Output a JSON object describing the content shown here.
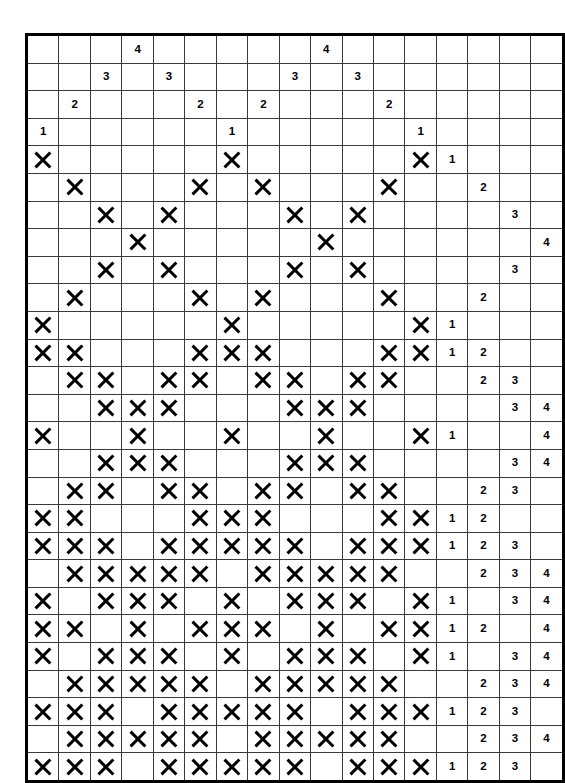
{
  "puzzle": {
    "title": "Nonogram Grid",
    "type": "nonogram",
    "grid_columns": 17,
    "grid_rows": 27,
    "play_columns": 13,
    "play_rows": 23,
    "header_rows": 4,
    "clue_columns": 4,
    "fill_glyph": "X",
    "ink_color": "#000000",
    "line_color": "#3a3a3a",
    "background_color": "#ffffff"
  },
  "column_clues": [
    [
      null,
      null,
      null,
      "1"
    ],
    [
      null,
      null,
      "2",
      null
    ],
    [
      null,
      "3",
      null,
      null
    ],
    [
      "4",
      null,
      null,
      null
    ],
    [
      null,
      "3",
      null,
      null
    ],
    [
      null,
      null,
      "2",
      null
    ],
    [
      null,
      null,
      null,
      "1"
    ],
    [
      null,
      null,
      "2",
      null
    ],
    [
      null,
      "3",
      null,
      null
    ],
    [
      "4",
      null,
      null,
      null
    ],
    [
      null,
      "3",
      null,
      null
    ],
    [
      null,
      null,
      "2",
      null
    ],
    [
      null,
      null,
      null,
      "1"
    ]
  ],
  "row_clues": [
    [
      "1",
      null,
      null,
      null
    ],
    [
      null,
      "2",
      null,
      null
    ],
    [
      null,
      null,
      "3",
      null
    ],
    [
      null,
      null,
      null,
      "4"
    ],
    [
      null,
      null,
      "3",
      null
    ],
    [
      null,
      "2",
      null,
      null
    ],
    [
      "1",
      null,
      null,
      null
    ],
    [
      "1",
      "2",
      null,
      null
    ],
    [
      null,
      "2",
      "3",
      null
    ],
    [
      null,
      null,
      "3",
      "4"
    ],
    [
      "1",
      null,
      null,
      "4"
    ],
    [
      null,
      null,
      "3",
      "4"
    ],
    [
      null,
      "2",
      "3",
      null
    ],
    [
      "1",
      "2",
      null,
      null
    ],
    [
      "1",
      "2",
      "3",
      null
    ],
    [
      null,
      "2",
      "3",
      "4"
    ],
    [
      "1",
      null,
      "3",
      "4"
    ],
    [
      "1",
      "2",
      null,
      "4"
    ],
    [
      "1",
      null,
      "3",
      "4"
    ],
    [
      null,
      "2",
      "3",
      "4"
    ],
    [
      "1",
      "2",
      "3",
      null
    ],
    [
      null,
      "2",
      "3",
      "4"
    ],
    [
      "1",
      "2",
      "3",
      null
    ]
  ],
  "cells": [
    [
      1,
      0,
      0,
      0,
      0,
      0,
      1,
      0,
      0,
      0,
      0,
      0,
      1
    ],
    [
      0,
      1,
      0,
      0,
      0,
      1,
      0,
      1,
      0,
      0,
      0,
      1,
      0
    ],
    [
      0,
      0,
      1,
      0,
      1,
      0,
      0,
      0,
      1,
      0,
      1,
      0,
      0
    ],
    [
      0,
      0,
      0,
      1,
      0,
      0,
      0,
      0,
      0,
      1,
      0,
      0,
      0
    ],
    [
      0,
      0,
      1,
      0,
      1,
      0,
      0,
      0,
      1,
      0,
      1,
      0,
      0
    ],
    [
      0,
      1,
      0,
      0,
      0,
      1,
      0,
      1,
      0,
      0,
      0,
      1,
      0
    ],
    [
      1,
      0,
      0,
      0,
      0,
      0,
      1,
      0,
      0,
      0,
      0,
      0,
      1
    ],
    [
      1,
      1,
      0,
      0,
      0,
      1,
      1,
      1,
      0,
      0,
      0,
      1,
      1
    ],
    [
      0,
      1,
      1,
      0,
      1,
      1,
      0,
      1,
      1,
      0,
      1,
      1,
      0
    ],
    [
      0,
      0,
      1,
      1,
      1,
      0,
      0,
      0,
      1,
      1,
      1,
      0,
      0
    ],
    [
      1,
      0,
      0,
      1,
      0,
      0,
      1,
      0,
      0,
      1,
      0,
      0,
      1
    ],
    [
      0,
      0,
      1,
      1,
      1,
      0,
      0,
      0,
      1,
      1,
      1,
      0,
      0
    ],
    [
      0,
      1,
      1,
      0,
      1,
      1,
      0,
      1,
      1,
      0,
      1,
      1,
      0
    ],
    [
      1,
      1,
      0,
      0,
      0,
      1,
      1,
      1,
      0,
      0,
      0,
      1,
      1
    ],
    [
      1,
      1,
      1,
      0,
      1,
      1,
      1,
      1,
      1,
      0,
      1,
      1,
      1
    ],
    [
      0,
      1,
      1,
      1,
      1,
      1,
      0,
      1,
      1,
      1,
      1,
      1,
      0
    ],
    [
      1,
      0,
      1,
      1,
      1,
      0,
      1,
      0,
      1,
      1,
      1,
      0,
      1
    ],
    [
      1,
      1,
      0,
      1,
      0,
      1,
      1,
      1,
      0,
      1,
      0,
      1,
      1
    ],
    [
      1,
      0,
      1,
      1,
      1,
      0,
      1,
      0,
      1,
      1,
      1,
      0,
      1
    ],
    [
      0,
      1,
      1,
      1,
      1,
      1,
      0,
      1,
      1,
      1,
      1,
      1,
      0
    ],
    [
      1,
      1,
      1,
      0,
      1,
      1,
      1,
      1,
      1,
      0,
      1,
      1,
      1
    ],
    [
      0,
      1,
      1,
      1,
      1,
      1,
      0,
      1,
      1,
      1,
      1,
      1,
      0
    ],
    [
      1,
      1,
      1,
      0,
      1,
      1,
      1,
      1,
      1,
      0,
      1,
      1,
      1
    ]
  ]
}
